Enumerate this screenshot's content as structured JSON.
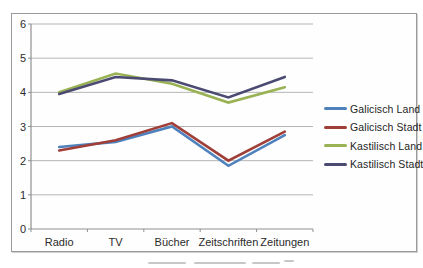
{
  "chart_data": {
    "type": "line",
    "title": "",
    "xlabel": "",
    "ylabel": "",
    "categories": [
      "Radio",
      "TV",
      "Bücher",
      "Zeitschriften",
      "Zeitungen"
    ],
    "series": [
      {
        "name": "Galicisch Land",
        "color": "#4F81BD",
        "values": [
          2.4,
          2.55,
          3.0,
          1.85,
          2.75
        ]
      },
      {
        "name": "Galicisch Stadt",
        "color": "#A03F38",
        "values": [
          2.3,
          2.6,
          3.1,
          2.0,
          2.85
        ]
      },
      {
        "name": "Kastilisch Land",
        "color": "#98B254",
        "values": [
          4.0,
          4.55,
          4.25,
          3.7,
          4.15
        ]
      },
      {
        "name": "Kastilisch Stadt",
        "color": "#4B4A72",
        "values": [
          3.95,
          4.45,
          4.35,
          3.85,
          4.45
        ]
      }
    ],
    "ylim": [
      0,
      6
    ],
    "yticks": [
      0,
      1,
      2,
      3,
      4,
      5,
      6
    ],
    "ytick_labels_top_to_bottom": [
      "6",
      "5",
      "4",
      "3",
      "2",
      "1",
      "0"
    ],
    "grid": "horizontal",
    "legend_position": "right",
    "grid_color": "#b5b5b5",
    "axis_color": "#8f8f8f",
    "text_color": "#2b2b2b"
  }
}
